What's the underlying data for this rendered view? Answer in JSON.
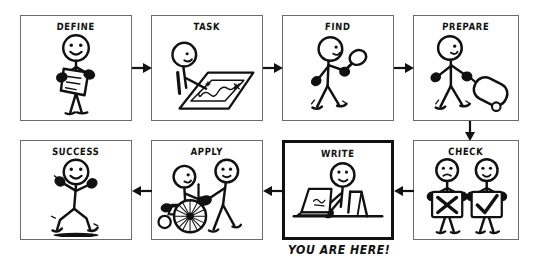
{
  "diagram": {
    "type": "process-flow",
    "canvas": {
      "width": 536,
      "height": 270
    },
    "style": "hand-drawn stick figure comic",
    "panels": [
      {
        "id": "define",
        "title": "DEFINE",
        "row": 1,
        "order": 1,
        "figure": "stick-figure holding clipboard",
        "x": 20,
        "y": 15,
        "w": 112,
        "h": 106,
        "highlight": false
      },
      {
        "id": "task",
        "title": "TASK",
        "row": 1,
        "order": 2,
        "figure": "stick-figure leaning over map with route",
        "x": 151,
        "y": 15,
        "w": 112,
        "h": 106,
        "highlight": false
      },
      {
        "id": "find",
        "title": "FIND",
        "row": 1,
        "order": 3,
        "figure": "stick-figure walking with magnifying glass",
        "x": 282,
        "y": 15,
        "w": 112,
        "h": 106,
        "highlight": false
      },
      {
        "id": "prepare",
        "title": "PREPARE",
        "row": 1,
        "order": 4,
        "figure": "stick-figure pulling rolling suitcase",
        "x": 413,
        "y": 15,
        "w": 106,
        "h": 106,
        "highlight": false
      },
      {
        "id": "check",
        "title": "CHECK",
        "row": 2,
        "order": 1,
        "figure": "two stick-figures holding cross sign and check sign",
        "x": 413,
        "y": 140,
        "w": 106,
        "h": 100,
        "highlight": false
      },
      {
        "id": "write",
        "title": "WRITE",
        "row": 2,
        "order": 2,
        "figure": "stick-figure at desk typing on laptop",
        "x": 282,
        "y": 140,
        "w": 112,
        "h": 100,
        "highlight": true
      },
      {
        "id": "apply",
        "title": "APPLY",
        "row": 2,
        "order": 3,
        "figure": "stick-figure pushing another in wheelchair",
        "x": 151,
        "y": 140,
        "w": 112,
        "h": 100,
        "highlight": false
      },
      {
        "id": "success",
        "title": "SUCCESS",
        "row": 2,
        "order": 4,
        "figure": "stick-figure running and cheering",
        "x": 20,
        "y": 140,
        "w": 112,
        "h": 100,
        "highlight": false
      }
    ],
    "arrows": [
      {
        "id": "define-to-task",
        "direction": "right",
        "x": 132,
        "y": 61,
        "length": 19
      },
      {
        "id": "task-to-find",
        "direction": "right",
        "x": 263,
        "y": 61,
        "length": 19
      },
      {
        "id": "find-to-prepare",
        "direction": "right",
        "x": 394,
        "y": 61,
        "length": 19
      },
      {
        "id": "prepare-to-check",
        "direction": "down",
        "x": 463,
        "y": 121,
        "length": 19
      },
      {
        "id": "check-to-write",
        "direction": "left",
        "x": 394,
        "y": 184,
        "length": 19
      },
      {
        "id": "write-to-apply",
        "direction": "left",
        "x": 263,
        "y": 184,
        "length": 19
      },
      {
        "id": "apply-to-success",
        "direction": "left",
        "x": 132,
        "y": 184,
        "length": 19
      }
    ],
    "annotation": {
      "id": "you-are-here",
      "text": "YOU ARE HERE!",
      "points_to": "write",
      "x": 288,
      "y": 243
    },
    "colors": {
      "ink": "#111111",
      "panel_border": "#6b6b6b",
      "highlight_border": "#111111",
      "background": "#ffffff"
    }
  }
}
